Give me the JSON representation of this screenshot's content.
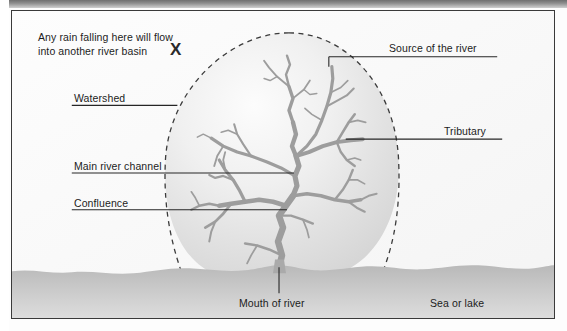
{
  "diagram": {
    "background_color": "#fcfcfc",
    "frame_color": "#3a3a3a",
    "basin_fill_light": "#fafafa",
    "basin_fill_mid": "#dcdcdc",
    "river_color": "#9b9b9b",
    "sea_color_top": "#bdbdbd",
    "sea_color_bottom": "#d8d8d8",
    "leader_line_color": "#2b2b2b",
    "watershed_line_style": "dashed"
  },
  "annotations": {
    "rain_note_line1": "Any rain falling here will flow",
    "rain_note_line2": "into another river basin",
    "x_marker": "X",
    "watershed": "Watershed",
    "main_river_channel": "Main river channel",
    "confluence": "Confluence",
    "source_of_the_river": "Source of the river",
    "tributary": "Tributary",
    "mouth_of_river": "Mouth of river",
    "sea_or_lake": "Sea or lake"
  }
}
